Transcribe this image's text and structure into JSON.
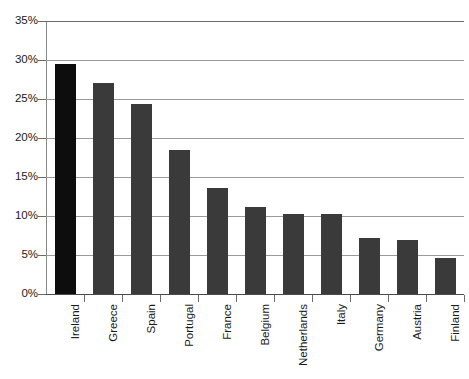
{
  "chart_data": {
    "type": "bar",
    "title": "",
    "subtitle": "",
    "xlabel": "",
    "ylabel": "",
    "categories": [
      "Ireland",
      "Greece",
      "Spain",
      "Portugal",
      "France",
      "Belgium",
      "Netherlands",
      "Italy",
      "Germany",
      "Austria",
      "Finland"
    ],
    "values": [
      29.5,
      27.0,
      24.3,
      18.5,
      13.6,
      11.1,
      10.3,
      10.2,
      7.2,
      6.9,
      4.6
    ],
    "value_labels": [
      "29.5%",
      "27.0%",
      "24.3%",
      "18.5%",
      "13.6%",
      "11.1%",
      "10.3%",
      "10.2%",
      "7.2%",
      "6.9%",
      "4.6%"
    ],
    "ylim": [
      0,
      35
    ],
    "ytick_values": [
      0,
      5,
      10,
      15,
      20,
      25,
      30,
      35
    ],
    "ytick_labels": [
      "0%",
      "5%",
      "10%",
      "15%",
      "20%",
      "25%",
      "30%",
      "35%"
    ],
    "grid": true,
    "grid_axis": "y",
    "legend": false,
    "legend_position": "none",
    "series": [
      {
        "name": "",
        "values": [
          29.5,
          27.0,
          24.3,
          18.5,
          13.6,
          11.1,
          10.3,
          10.2,
          7.2,
          6.9,
          4.6
        ]
      }
    ],
    "colors": {
      "bar_default": "#3a3a3a",
      "bar_highlight": "#0d0d0d",
      "gridline": "#9a9a9a",
      "axis": "#4a4a4a",
      "text": "#1a1a1a",
      "background": "#ffffff"
    },
    "highlight_index": 0
  }
}
